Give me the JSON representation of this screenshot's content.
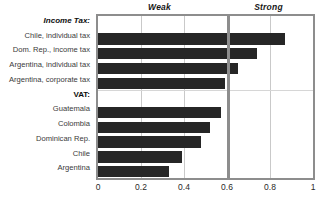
{
  "chart_data": {
    "type": "bar",
    "orientation": "horizontal",
    "title": "",
    "xlabel": "",
    "ylabel": "",
    "xlim": [
      0,
      1
    ],
    "grid": true,
    "legend": null,
    "band_labels": [
      {
        "text": "Weak",
        "from": 0.0,
        "to": 0.6
      },
      {
        "text": "Strong",
        "from": 0.6,
        "to": 1.0
      }
    ],
    "threshold_line": 0.6,
    "xticks": [
      "0",
      "0.2",
      "0.4",
      "0.6",
      "0.8",
      "1"
    ],
    "xtick_values": [
      0,
      0.2,
      0.4,
      0.6,
      0.8,
      1
    ],
    "bar_color": "#262626",
    "groups": [
      {
        "header": "Income Tax:",
        "categories": [
          "Chile, individual tax",
          "Dom. Rep., income tax",
          "Argentina, individual tax",
          "Argentina, corporate tax"
        ],
        "values": [
          0.87,
          0.74,
          0.65,
          0.59
        ]
      },
      {
        "header": "VAT:",
        "categories": [
          "Guatemala",
          "Colombia",
          "Dominican Rep.",
          "Chile",
          "Argentina"
        ],
        "values": [
          0.57,
          0.52,
          0.48,
          0.39,
          0.33
        ]
      }
    ],
    "categories": [
      "Income Tax:",
      "Chile, individual tax",
      "Dom. Rep., income tax",
      "Argentina, individual tax",
      "Argentina, corporate tax",
      "VAT:",
      "Guatemala",
      "Colombia",
      "Dominican Rep.",
      "Chile",
      "Argentina"
    ],
    "values": [
      null,
      0.87,
      0.74,
      0.65,
      0.59,
      null,
      0.57,
      0.52,
      0.48,
      0.39,
      0.33
    ]
  }
}
